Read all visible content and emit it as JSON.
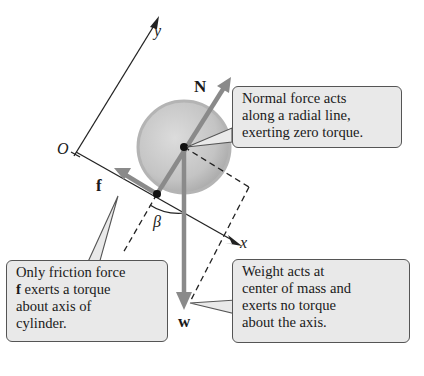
{
  "diagram": {
    "axes": {
      "origin_label": "O",
      "x_label": "x",
      "y_label": "y"
    },
    "angle_label": "β",
    "forces": {
      "normal": {
        "label": "N",
        "color": "#8a8a8a"
      },
      "friction": {
        "label": "f",
        "color": "#8a8a8a"
      },
      "weight": {
        "label": "w",
        "color": "#8a8a8a"
      }
    },
    "cylinder": {
      "fill": "#c8c8c8",
      "rim": "#a8a8a8"
    },
    "callouts": {
      "normal": {
        "lines": [
          "Normal force acts",
          "along a radial line,",
          "exerting zero torque."
        ]
      },
      "friction": {
        "lines": [
          "Only friction force",
          "exerts a torque",
          "about axis of",
          "cylinder."
        ],
        "bold_prefix": "f"
      },
      "weight": {
        "lines": [
          "Weight acts at",
          "center of mass and",
          "exerts no torque",
          "about the axis."
        ]
      }
    },
    "callout_bg": "#e9e9e9"
  }
}
